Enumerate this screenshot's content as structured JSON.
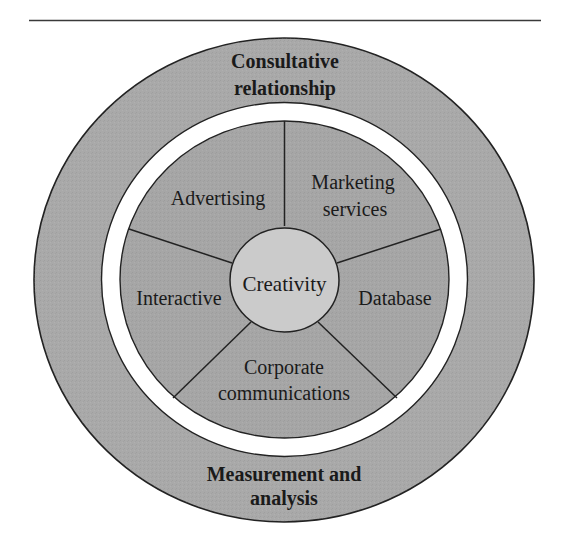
{
  "diagram": {
    "type": "concentric-wheel",
    "outer_ring": {
      "top_label": [
        "Consultative",
        "relationship"
      ],
      "bottom_label": [
        "Measurement and",
        "analysis"
      ],
      "fill": "#a9a9a9"
    },
    "separator_ring": {
      "fill": "#ffffff"
    },
    "segments": [
      {
        "id": "advertising",
        "lines": [
          "Advertising"
        ]
      },
      {
        "id": "marketing-services",
        "lines": [
          "Marketing",
          "services"
        ]
      },
      {
        "id": "database",
        "lines": [
          "Database"
        ]
      },
      {
        "id": "corporate-communications",
        "lines": [
          "Corporate",
          "communications"
        ]
      },
      {
        "id": "interactive",
        "lines": [
          "Interactive"
        ]
      }
    ],
    "segments_fill": "#a6a6a6",
    "center": {
      "label": "Creativity",
      "fill": "#cbcbcb"
    },
    "stroke_color": "#222222"
  }
}
